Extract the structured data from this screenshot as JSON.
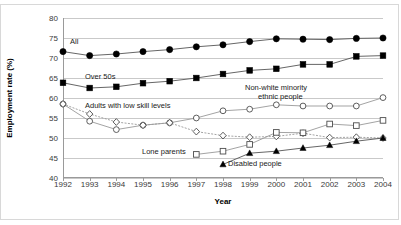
{
  "chart_data": {
    "type": "line",
    "title": "",
    "xlabel": "Year",
    "ylabel": "Employment rate (%)",
    "xlim": [
      1992,
      2004
    ],
    "ylim": [
      40,
      80
    ],
    "ytick_step": 5,
    "grid": true,
    "legend": "inline-annotations",
    "categories": [
      1992,
      1993,
      1994,
      1995,
      1996,
      1997,
      1998,
      1999,
      2000,
      2001,
      2002,
      2003,
      2004
    ],
    "xtick_labels": [
      "1992",
      "1993",
      "1994",
      "1995",
      "1996",
      "1997",
      "1998",
      "1999",
      "2000",
      "2001",
      "2002",
      "2003",
      "2004"
    ],
    "ytick_labels": [
      "40",
      "45",
      "50",
      "55",
      "60",
      "65",
      "70",
      "75",
      "80"
    ],
    "series": [
      {
        "name": "All",
        "marker": "filled-circle",
        "color": "#000000",
        "x": [
          1992,
          1993,
          1994,
          1995,
          1996,
          1997,
          1998,
          1999,
          2000,
          2001,
          2002,
          2003,
          2004
        ],
        "values": [
          71.6,
          70.6,
          71.0,
          71.6,
          72.1,
          72.8,
          73.3,
          74.1,
          74.8,
          74.7,
          74.6,
          74.9,
          75.0
        ]
      },
      {
        "name": "Over 50s",
        "marker": "filled-square",
        "color": "#000000",
        "x": [
          1992,
          1993,
          1994,
          1995,
          1996,
          1997,
          1998,
          1999,
          2000,
          2001,
          2002,
          2003,
          2004
        ],
        "values": [
          63.8,
          62.5,
          62.8,
          63.7,
          64.2,
          65.0,
          66.0,
          66.9,
          67.3,
          68.4,
          68.4,
          70.4,
          70.6
        ]
      },
      {
        "name": "Non-white minority ethnic people",
        "marker": "open-circle",
        "color": "#555555",
        "x": [
          1992,
          1993,
          1994,
          1995,
          1996,
          1997,
          1998,
          1999,
          2000,
          2001,
          2002,
          2003,
          2004
        ],
        "values": [
          58.5,
          54.2,
          52.1,
          53.2,
          53.8,
          55.0,
          56.8,
          57.2,
          58.3,
          58.0,
          58.0,
          58.0,
          60.1
        ]
      },
      {
        "name": "Adults with low skill levels",
        "marker": "open-diamond",
        "color": "#555555",
        "x": [
          1992,
          1993,
          1994,
          1995,
          1996,
          1997,
          1998,
          1999,
          2000,
          2001,
          2002,
          2003,
          2004
        ],
        "values": [
          58.5,
          56.0,
          54.0,
          53.2,
          53.8,
          51.6,
          50.6,
          50.2,
          50.4,
          51.2,
          50.1,
          50.2,
          50.0
        ]
      },
      {
        "name": "Lone parents",
        "marker": "open-square",
        "color": "#555555",
        "x": [
          1997,
          1998,
          1999,
          2000,
          2001,
          2002,
          2003,
          2004
        ],
        "values": [
          45.9,
          46.7,
          48.4,
          51.4,
          51.3,
          53.5,
          53.1,
          54.4
        ]
      },
      {
        "name": "Disabled people",
        "marker": "filled-triangle",
        "color": "#000000",
        "x": [
          1998,
          1999,
          2000,
          2001,
          2002,
          2003,
          2004
        ],
        "values": [
          43.4,
          46.2,
          46.7,
          47.5,
          48.2,
          49.2,
          50.0
        ]
      }
    ],
    "annotations": [
      {
        "id": "all",
        "text": "All"
      },
      {
        "id": "over50s",
        "text": "Over 50s"
      },
      {
        "id": "lowskill",
        "text": "Adults with low skill levels"
      },
      {
        "id": "minority_l1",
        "text": "Non-white minority"
      },
      {
        "id": "minority_l2",
        "text": "ethnic people"
      },
      {
        "id": "loneparents",
        "text": "Lone parents"
      },
      {
        "id": "disabled",
        "text": "Disabled people"
      }
    ]
  }
}
